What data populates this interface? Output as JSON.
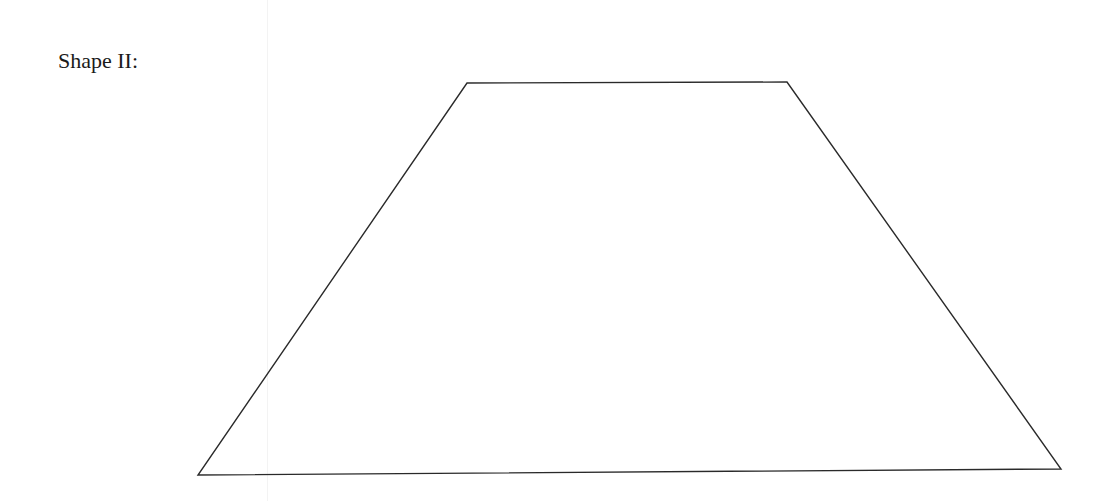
{
  "page": {
    "label": "Shape II:",
    "shape": {
      "type": "trapezoid",
      "stroke_color": "#2a2a2a",
      "vertices": [
        [
          467,
          83
        ],
        [
          787,
          82
        ],
        [
          1061,
          469
        ],
        [
          198,
          475
        ]
      ]
    }
  }
}
